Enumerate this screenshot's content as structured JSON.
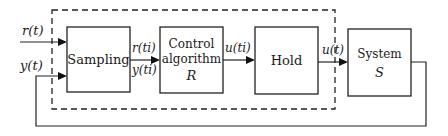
{
  "diagram": {
    "blocks": {
      "sampling": {
        "label": "Sampling"
      },
      "control": {
        "line1": "Control",
        "line2": "algorithm",
        "line3": "R"
      },
      "hold": {
        "label": "Hold"
      },
      "system": {
        "line1": "System",
        "line2": "S"
      }
    },
    "signals": {
      "reference_in": "r(t)",
      "output_in": "y(t)",
      "sampled_reference": "r(ti)",
      "sampled_output": "y(ti)",
      "control_discrete": "u(ti)",
      "control_continuous": "u(t)"
    },
    "boundary": {
      "style": "dashed",
      "encloses": [
        "sampling",
        "control",
        "hold"
      ]
    },
    "feedback": {
      "from": "system",
      "to": "sampling",
      "signal": "y(t)"
    }
  }
}
